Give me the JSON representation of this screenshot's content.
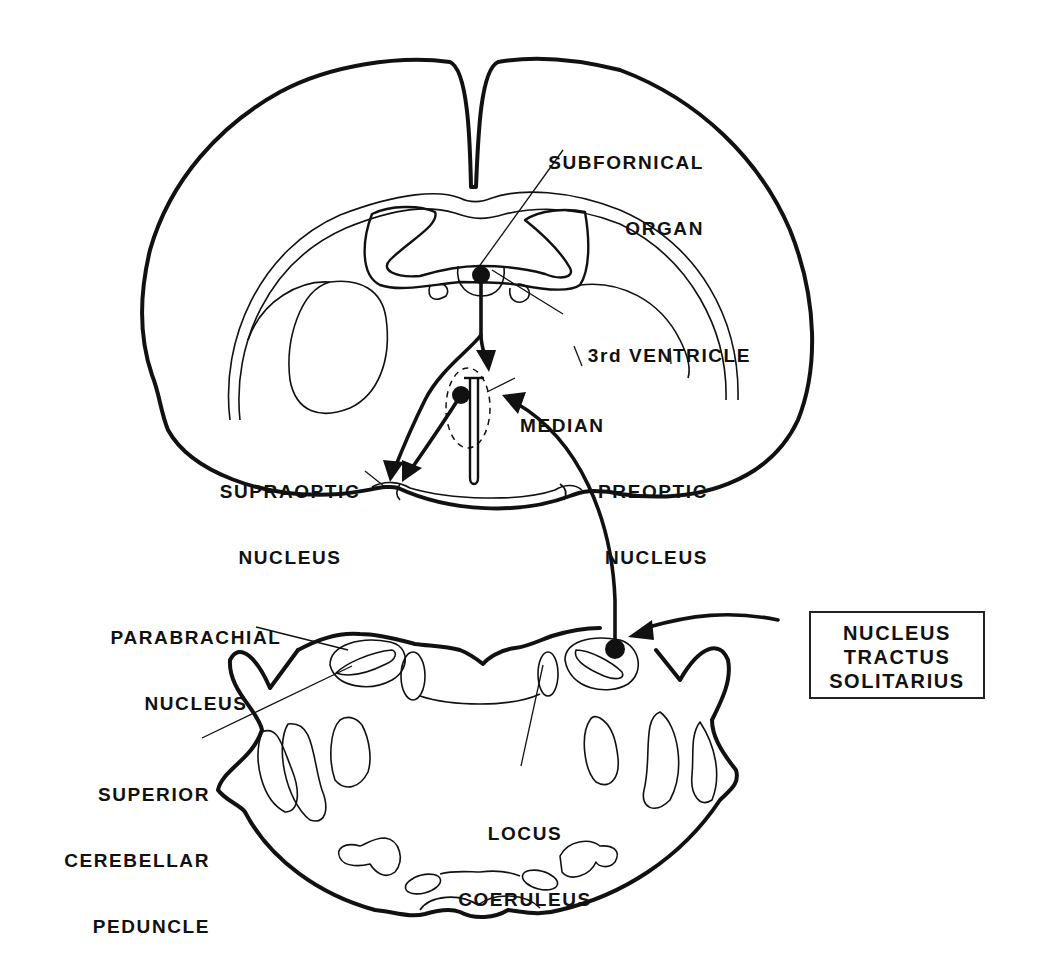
{
  "figure": {
    "type": "neuroanatomy-schematic",
    "colors": {
      "ink": "#111111",
      "background": "#ffffff"
    }
  },
  "labels": {
    "subfornical_organ": {
      "line1": "SUBFORNICAL",
      "line2": "ORGAN"
    },
    "third_ventricle": "3rd VENTRICLE",
    "median_preoptic_nucleus": {
      "line1": "MEDIAN",
      "line2": "PREOPTIC",
      "line3": "NUCLEUS"
    },
    "supraoptic_nucleus": {
      "line1": "SUPRAOPTIC",
      "line2": "NUCLEUS"
    },
    "parabrachial_nucleus": {
      "line1": "PARABRACHIAL",
      "line2": "NUCLEUS"
    },
    "superior_cerebellar_peduncle": {
      "line1": "SUPERIOR",
      "line2": "CEREBELLAR",
      "line3": "PEDUNCLE"
    },
    "locus_coeruleus": {
      "line1": "LOCUS",
      "line2": "COERULEUS"
    },
    "nucleus_tractus_solitarius": {
      "line1": "NUCLEUS",
      "line2": "TRACTUS",
      "line3": "SOLITARIUS"
    }
  },
  "pathways": [
    {
      "from": "SUBFORNICAL ORGAN",
      "to": "MEDIAN PREOPTIC NUCLEUS"
    },
    {
      "from": "SUBFORNICAL ORGAN",
      "to": "SUPRAOPTIC NUCLEUS"
    },
    {
      "from": "MEDIAN PREOPTIC NUCLEUS",
      "to": "SUPRAOPTIC NUCLEUS"
    },
    {
      "from": "NUCLEUS TRACTUS SOLITARIUS",
      "to": "MEDIAN PREOPTIC NUCLEUS"
    },
    {
      "from": "external input",
      "to": "NUCLEUS TRACTUS SOLITARIUS"
    }
  ]
}
